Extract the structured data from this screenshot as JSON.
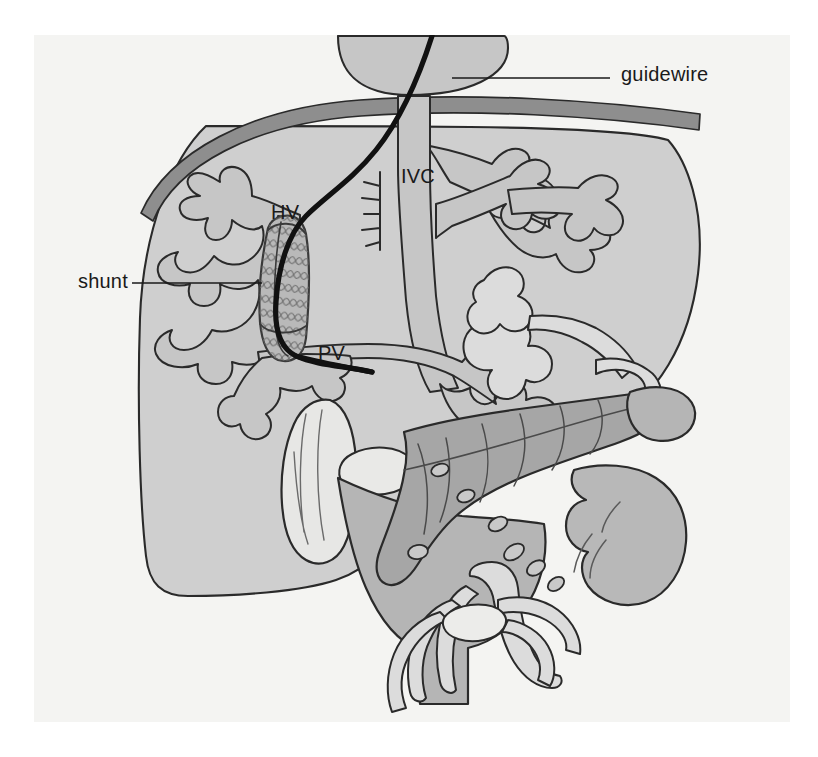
{
  "figure": {
    "kind": "medical-illustration",
    "title_visible": false,
    "background_color": "#ffffff",
    "panel_color": "#f4f4f2",
    "panel_rect": [
      34,
      35,
      756,
      687
    ],
    "ink_color": "#1d1d1d"
  },
  "palette": {
    "liver_fill": "#cfcfcf",
    "vessel_fill": "#c6c6c6",
    "pancreas_fill": "#a6a6a6",
    "stomach_fill": "#b5b5b5",
    "duodenum_fill": "#b8b8b8",
    "gallbladder_fill": "#e7e7e5",
    "bowel_fill": "#dcdcdc",
    "diaphragm_fill": "#8e8e8e",
    "stent_fill": "#b9b9b9",
    "guidewire_color": "#111111",
    "outline_color": "#2a2a2a",
    "leader_color": "#1a1a1a",
    "text_color": "#1a1a1a"
  },
  "callouts": [
    {
      "id": "guidewire",
      "label": "guidewire",
      "text_position": [
        621,
        63
      ],
      "leader_from": [
        610,
        78
      ],
      "leader_to": [
        452,
        78
      ],
      "anchor_target": "guidewire-catheter-in-right-atrium"
    },
    {
      "id": "shunt",
      "label": "shunt",
      "text_position": [
        78,
        270
      ],
      "leader_from": [
        132,
        283
      ],
      "leader_to": [
        262,
        283
      ],
      "anchor_target": "mesh-stent-between-portal-and-hepatic-vein"
    }
  ],
  "anatomy_labels": [
    {
      "id": "hv",
      "label": "HV",
      "position": [
        271,
        201
      ],
      "meaning": "hepatic vein"
    },
    {
      "id": "ivc",
      "label": "IVC",
      "position": [
        401,
        165
      ],
      "meaning": "inferior vena cava"
    },
    {
      "id": "pv",
      "label": "PV",
      "position": [
        318,
        342
      ],
      "meaning": "portal vein"
    }
  ],
  "structures": [
    {
      "id": "liver",
      "name": "liver",
      "fill": "#cfcfcf"
    },
    {
      "id": "diaphragm",
      "name": "diaphragm",
      "fill": "#8e8e8e"
    },
    {
      "id": "heart",
      "name": "right-atrium",
      "fill": "#c6c6c6"
    },
    {
      "id": "ivc-vessel",
      "name": "inferior-vena-cava",
      "fill": "#c6c6c6"
    },
    {
      "id": "hv-vessel",
      "name": "hepatic-veins",
      "fill": "#c6c6c6"
    },
    {
      "id": "pv-vessel",
      "name": "portal-vein",
      "fill": "#c6c6c6"
    },
    {
      "id": "pancreas",
      "name": "pancreas",
      "fill": "#a6a6a6"
    },
    {
      "id": "stomach",
      "name": "stomach",
      "fill": "#b5b5b5"
    },
    {
      "id": "duodenum",
      "name": "duodenum",
      "fill": "#b8b8b8"
    },
    {
      "id": "gallbladder",
      "name": "gallbladder",
      "fill": "#e7e7e5"
    },
    {
      "id": "spleen",
      "name": "spleen",
      "fill": "#b5b5b5"
    },
    {
      "id": "mesenteric",
      "name": "mesenteric-vessels",
      "fill": "#dcdcdc"
    },
    {
      "id": "stent",
      "name": "mesh-stent",
      "fill": "#b9b9b9"
    },
    {
      "id": "guidewire",
      "name": "guidewire",
      "fill": "#111111"
    }
  ]
}
